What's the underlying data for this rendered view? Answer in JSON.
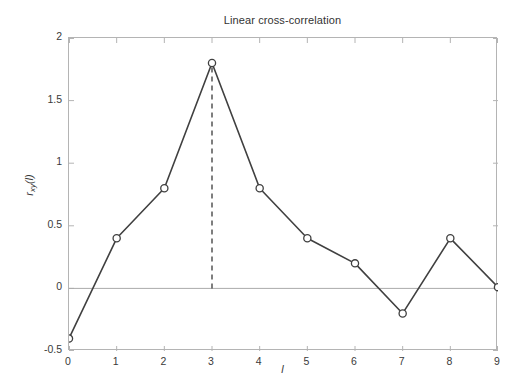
{
  "chart_data": {
    "type": "line",
    "title": "Linear cross-correlation",
    "xlabel": "l",
    "ylabel": "r_xy(l)",
    "ylabel_base": "r",
    "ylabel_sub": "xy",
    "ylabel_arg": "(l)",
    "x": [
      0,
      1,
      2,
      3,
      4,
      5,
      6,
      7,
      8,
      9
    ],
    "values": [
      -0.4,
      0.4,
      0.8,
      1.8,
      0.8,
      0.4,
      0.2,
      -0.2,
      0.4,
      0.01
    ],
    "series": [
      {
        "name": "r_xy(l)",
        "values": [
          -0.4,
          0.4,
          0.8,
          1.8,
          0.8,
          0.4,
          0.2,
          -0.2,
          0.4,
          0.01
        ]
      }
    ],
    "xlim": [
      0,
      9
    ],
    "ylim": [
      -0.5,
      2
    ],
    "xticks": [
      0,
      1,
      2,
      3,
      4,
      5,
      6,
      7,
      8,
      9
    ],
    "xtick_labels": [
      "0",
      "1",
      "2",
      "3",
      "4",
      "5",
      "6",
      "7",
      "8",
      "9"
    ],
    "yticks": [
      -0.5,
      0,
      0.5,
      1,
      1.5,
      2
    ],
    "ytick_labels": [
      "-0.5",
      "0",
      "0.5",
      "1",
      "1.5",
      "2"
    ],
    "grid": false,
    "legend": false,
    "marker": "open-circle",
    "annotations": [
      {
        "name": "peak-dashed-line",
        "type": "vertical-dashed-line",
        "x": 3,
        "y_from": 0,
        "y_to": 1.8
      },
      {
        "name": "zero-line",
        "type": "horizontal-line",
        "y": 0
      }
    ],
    "colors": {
      "line": "#404040",
      "marker_edge": "#404040",
      "marker_face": "#ffffff",
      "axis": "#b4b4b4",
      "zero_line": "#aaaaaa",
      "dashed": "#3a3a3a",
      "text": "#3a3a3a",
      "background": "#ffffff"
    }
  }
}
